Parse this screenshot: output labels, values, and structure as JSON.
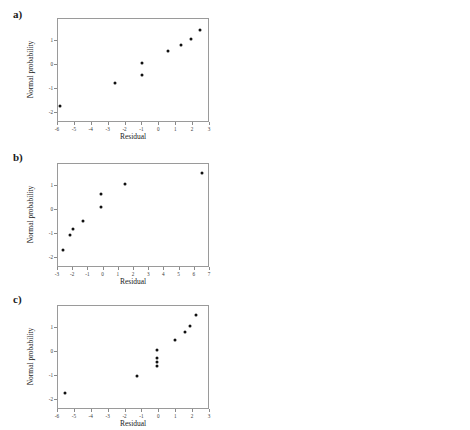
{
  "figure": {
    "panels": [
      {
        "key": "a",
        "label": "a)",
        "left": {
          "name": "normal-probability-plot-a",
          "chart": {
            "type": "scatter",
            "title": "",
            "xlabel": "Residual",
            "ylabel": "Normal probability",
            "xlim": [
              -6,
              3
            ],
            "ylim": [
              -2.4,
              1.9
            ],
            "xticks": [
              -6,
              -5,
              -4,
              -3,
              -2,
              -1,
              0,
              1,
              2,
              3
            ],
            "xticklabels": [
              "-6",
              "-5",
              "-4",
              "-3",
              "-2",
              "-1",
              "0",
              "1",
              "2",
              "3"
            ],
            "yticks": [
              1,
              0,
              -1,
              -2
            ],
            "yticklabels": [
              "1",
              "0",
              "-1",
              "-2"
            ],
            "grid": false,
            "points": [
              {
                "x": -5.85,
                "y": -1.72
              },
              {
                "x": -2.55,
                "y": -0.78
              },
              {
                "x": -0.95,
                "y": -0.45
              },
              {
                "x": -0.95,
                "y": 0.03
              },
              {
                "x": 0.55,
                "y": 0.52
              },
              {
                "x": 1.35,
                "y": 0.78
              },
              {
                "x": 1.95,
                "y": 1.05
              },
              {
                "x": 2.45,
                "y": 1.42
              }
            ]
          }
        },
        "right": {
          "name": "residual-vs-fitted-plot-a",
          "chart": {
            "type": "scatter",
            "title": "",
            "xlabel": "Fitted Value",
            "ylabel": "Residual",
            "xlim": [
              5,
              95
            ],
            "ylim": [
              -6.6,
              2.6
            ],
            "xticks": [
              10,
              20,
              30,
              40,
              50,
              60,
              70,
              80,
              90
            ],
            "xticklabels": [
              "10",
              "20",
              "30",
              "40",
              "50",
              "60",
              "70",
              "80",
              "90"
            ],
            "yticks": [
              2,
              1,
              0,
              -1,
              -2,
              -3,
              -4,
              -5,
              -6
            ],
            "yticklabels": [
              "2",
              "1",
              "0",
              "-1",
              "-2",
              "-3",
              "-4",
              "-5",
              "-6"
            ],
            "grid": false,
            "points": [
              {
                "x": 12.5,
                "y": 0.0
              },
              {
                "x": 18.5,
                "y": 0.0
              },
              {
                "x": 24.5,
                "y": 0.0
              },
              {
                "x": 27.5,
                "y": 1.55
              },
              {
                "x": 36.0,
                "y": 1.45
              },
              {
                "x": 47.5,
                "y": 0.85
              },
              {
                "x": 47.5,
                "y": 0.0
              },
              {
                "x": 48.0,
                "y": -1.5
              },
              {
                "x": 49.5,
                "y": -6.0
              },
              {
                "x": 71.5,
                "y": 1.75
              },
              {
                "x": 90.5,
                "y": 0.0
              }
            ]
          }
        }
      },
      {
        "key": "b",
        "label": "b)",
        "left": {
          "name": "normal-probability-plot-b",
          "chart": {
            "type": "scatter",
            "title": "",
            "xlabel": "Residual",
            "ylabel": "Normal probability",
            "xlim": [
              -3,
              7
            ],
            "ylim": [
              -2.4,
              1.9
            ],
            "xticks": [
              -3,
              -2,
              -1,
              0,
              1,
              2,
              3,
              4,
              5,
              6,
              7
            ],
            "xticklabels": [
              "-3",
              "-2",
              "-1",
              "0",
              "1",
              "2",
              "3",
              "4",
              "5",
              "6",
              "7"
            ],
            "yticks": [
              1,
              0,
              -1,
              -2
            ],
            "yticklabels": [
              "1",
              "0",
              "-1",
              "-2"
            ],
            "grid": false,
            "points": [
              {
                "x": -2.62,
                "y": -1.68
              },
              {
                "x": -2.15,
                "y": -1.08
              },
              {
                "x": -1.95,
                "y": -0.82
              },
              {
                "x": -1.3,
                "y": -0.48
              },
              {
                "x": -0.1,
                "y": 0.07
              },
              {
                "x": -0.12,
                "y": 0.62
              },
              {
                "x": 1.5,
                "y": 1.05
              },
              {
                "x": 6.55,
                "y": 1.5
              }
            ]
          }
        },
        "right": {
          "name": "residual-vs-fitted-plot-b",
          "chart": {
            "type": "scatter",
            "title": "",
            "xlabel": "Fitted Value",
            "ylabel": "Residual",
            "xlim": [
              0,
              50
            ],
            "ylim": [
              -3.3,
              7.3
            ],
            "xticks": [
              0,
              10,
              20,
              30,
              40,
              50
            ],
            "xticklabels": [
              "0",
              "10",
              "20",
              "30",
              "40",
              "50"
            ],
            "yticks": [
              7,
              6,
              5,
              4,
              3,
              2,
              1,
              0,
              -1,
              -2,
              -3
            ],
            "yticklabels": [
              "7",
              "6",
              "5",
              "4",
              "3",
              "2",
              "1",
              "0",
              "-1",
              "-2",
              "-3"
            ],
            "grid": false,
            "points": [
              {
                "x": 4.3,
                "y": 0.0
              },
              {
                "x": 9.8,
                "y": 0.0
              },
              {
                "x": 9.8,
                "y": -2.2
              },
              {
                "x": 14.3,
                "y": 1.5
              },
              {
                "x": 14.3,
                "y": 0.0
              },
              {
                "x": 27.2,
                "y": -1.1
              },
              {
                "x": 27.2,
                "y": -2.6
              },
              {
                "x": 30.0,
                "y": 6.5
              },
              {
                "x": 33.5,
                "y": 0.0
              },
              {
                "x": 34.2,
                "y": 0.0
              },
              {
                "x": 46.0,
                "y": -2.0
              }
            ]
          }
        }
      },
      {
        "key": "c",
        "label": "c)",
        "left": {
          "name": "normal-probability-plot-c",
          "chart": {
            "type": "scatter",
            "title": "",
            "xlabel": "Residual",
            "ylabel": "Normal probability",
            "xlim": [
              -6,
              3
            ],
            "ylim": [
              -2.4,
              1.9
            ],
            "xticks": [
              -6,
              -5,
              -4,
              -3,
              -2,
              -1,
              0,
              1,
              2,
              3
            ],
            "xticklabels": [
              "-6",
              "-5",
              "-4",
              "-3",
              "-2",
              "-1",
              "0",
              "1",
              "2",
              "3"
            ],
            "yticks": [
              1,
              0,
              -1,
              -2
            ],
            "yticklabels": [
              "1",
              "0",
              "-1",
              "-2"
            ],
            "grid": false,
            "points": [
              {
                "x": -5.55,
                "y": -1.72
              },
              {
                "x": -1.25,
                "y": -1.02
              },
              {
                "x": -0.05,
                "y": -0.62
              },
              {
                "x": -0.05,
                "y": -0.45
              },
              {
                "x": -0.05,
                "y": -0.28
              },
              {
                "x": -0.05,
                "y": 0.05
              },
              {
                "x": 1.0,
                "y": 0.45
              },
              {
                "x": 1.6,
                "y": 0.78
              },
              {
                "x": 1.85,
                "y": 1.05
              },
              {
                "x": 2.25,
                "y": 1.48
              }
            ]
          }
        },
        "right": {
          "name": "residual-vs-fitted-plot-c",
          "chart": {
            "type": "scatter",
            "title": "",
            "xlabel": "Fitted Value",
            "ylabel": "Residual",
            "xlim": [
              0,
              650
            ],
            "ylim": [
              -6.4,
              3.2
            ],
            "xticks": [
              0,
              100,
              200,
              300,
              400,
              500,
              600
            ],
            "xticklabels": [
              "0",
              "100",
              "200",
              "300",
              "400",
              "500",
              "600"
            ],
            "yticks": [
              3,
              2,
              1,
              0,
              -1,
              -2,
              -3,
              -4,
              -5,
              -6
            ],
            "yticklabels": [
              "3",
              "2",
              "1",
              "0",
              "-1",
              "-2",
              "-3",
              "-4",
              "-5",
              "-6"
            ],
            "grid": false,
            "points": [
              {
                "x": 22,
                "y": 0.0
              },
              {
                "x": 25,
                "y": -1.2
              },
              {
                "x": 60,
                "y": 0.0
              },
              {
                "x": 62,
                "y": 2.0
              },
              {
                "x": 140,
                "y": 0.0
              },
              {
                "x": 172,
                "y": 2.3
              },
              {
                "x": 250,
                "y": 1.5
              },
              {
                "x": 295,
                "y": 0.0
              },
              {
                "x": 298,
                "y": -5.5
              },
              {
                "x": 378,
                "y": 0.0
              },
              {
                "x": 565,
                "y": 1.9
              }
            ]
          }
        }
      }
    ]
  }
}
